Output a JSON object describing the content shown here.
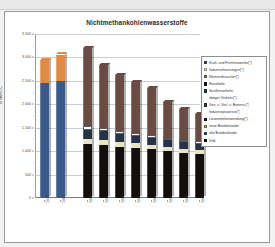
{
  "chart_data": {
    "type": "bar",
    "stacked": true,
    "title": "Nichtmethankohlenwasserstoffe",
    "xlabel": "",
    "ylabel": "kt NMVOC",
    "ylim": [
      0,
      3500
    ],
    "yticks": [
      0,
      500,
      1000,
      1500,
      2000,
      2500,
      3000,
      3500
    ],
    "ytick_labels": [
      "0",
      "500",
      "1.000",
      "1.500",
      "2.000",
      "2.500",
      "3.000",
      "3.500"
    ],
    "grid": true,
    "legend_position": "right",
    "categories": [
      "1970",
      "1980",
      "1990",
      "1991",
      "1992",
      "1993",
      "1994",
      "1995",
      "1996",
      "1997"
    ],
    "series": [
      {
        "name": "Kraft- und Fernheizwerke(*)",
        "color": "#3a5a8c",
        "values": [
          0,
          0,
          0,
          0,
          0,
          0,
          0,
          0,
          0,
          0
        ]
      },
      {
        "name": "Industriefeuerungen(*)",
        "color": "#e8e4c0",
        "values": [
          0,
          0,
          0,
          0,
          0,
          0,
          0,
          0,
          0,
          0
        ]
      },
      {
        "name": "Kleinverbraucher(*)",
        "color": "#9e6a6a",
        "values": [
          0,
          0,
          0,
          0,
          0,
          0,
          0,
          0,
          0,
          0
        ]
      },
      {
        "name": "Haushalte",
        "color": "#1b1b2a",
        "values": [
          0,
          0,
          0,
          0,
          0,
          0,
          0,
          0,
          0,
          0
        ]
      },
      {
        "name": "Straßenverkehr",
        "color": "#24435f",
        "values": [
          0,
          0,
          0,
          0,
          0,
          0,
          0,
          0,
          0,
          0
        ]
      },
      {
        "name": "übriger Verkehr(*)",
        "color": "#ffffff",
        "values": [
          0,
          0,
          0,
          0,
          0,
          0,
          0,
          0,
          0,
          0
        ]
      },
      {
        "name": "Ges. u. Verl. v. Brennst.(*)",
        "color": "#2f3b55",
        "values": [
          0,
          0,
          0,
          0,
          0,
          0,
          0,
          0,
          0,
          0
        ]
      },
      {
        "name": "Industrieprozesse(*)",
        "color": "#ffffff",
        "values": [
          0,
          0,
          0,
          0,
          0,
          0,
          0,
          0,
          0,
          0
        ]
      },
      {
        "name": "Lösemittelverwendung(*)",
        "color": "#1e1e1e",
        "values": [
          0,
          0,
          0,
          0,
          0,
          0,
          0,
          0,
          0,
          0
        ]
      },
      {
        "name": "neue Bundesländer",
        "color": "#e08a43",
        "values": [
          490,
          560,
          0,
          0,
          0,
          0,
          0,
          0,
          0,
          0
        ]
      },
      {
        "name": "alte Bundesländer",
        "color": "#3a5a8c",
        "values": [
          2450,
          2500,
          0,
          0,
          0,
          0,
          0,
          0,
          0,
          0
        ]
      },
      {
        "name": "Dtld.",
        "color": "#120f0d",
        "values": [
          0,
          0,
          3200,
          2830,
          2620,
          2470,
          2350,
          2040,
          1900,
          1790
        ]
      }
    ],
    "stacks": {
      "1970": [
        {
          "color": "#3a5a8c",
          "value": 2450
        },
        {
          "color": "#e08a43",
          "value": 490
        }
      ],
      "1980": [
        {
          "color": "#3a5a8c",
          "value": 2500
        },
        {
          "color": "#e08a43",
          "value": 560
        }
      ],
      "1990": [
        {
          "color": "#120f0d",
          "value": 1150
        },
        {
          "color": "#e8e4c0",
          "value": 120
        },
        {
          "color": "#253247",
          "value": 190
        },
        {
          "color": "#ffffff",
          "value": 75
        },
        {
          "color": "#6b4a42",
          "value": 1665
        }
      ],
      "1991": [
        {
          "color": "#120f0d",
          "value": 1130
        },
        {
          "color": "#e8e4c0",
          "value": 115
        },
        {
          "color": "#253247",
          "value": 175
        },
        {
          "color": "#ffffff",
          "value": 70
        },
        {
          "color": "#6b4a42",
          "value": 1340
        }
      ],
      "1992": [
        {
          "color": "#120f0d",
          "value": 1090
        },
        {
          "color": "#e8e4c0",
          "value": 110
        },
        {
          "color": "#253247",
          "value": 165
        },
        {
          "color": "#ffffff",
          "value": 65
        },
        {
          "color": "#6b4a42",
          "value": 1190
        }
      ],
      "1993": [
        {
          "color": "#120f0d",
          "value": 1060
        },
        {
          "color": "#e8e4c0",
          "value": 105
        },
        {
          "color": "#253247",
          "value": 155
        },
        {
          "color": "#ffffff",
          "value": 60
        },
        {
          "color": "#6b4a42",
          "value": 1090
        }
      ],
      "1994": [
        {
          "color": "#120f0d",
          "value": 1040
        },
        {
          "color": "#e8e4c0",
          "value": 100
        },
        {
          "color": "#253247",
          "value": 150
        },
        {
          "color": "#ffffff",
          "value": 58
        },
        {
          "color": "#6b4a42",
          "value": 1002
        }
      ],
      "1995": [
        {
          "color": "#120f0d",
          "value": 1000
        },
        {
          "color": "#e8e4c0",
          "value": 95
        },
        {
          "color": "#253247",
          "value": 140
        },
        {
          "color": "#ffffff",
          "value": 55
        },
        {
          "color": "#6b4a42",
          "value": 750
        }
      ],
      "1996": [
        {
          "color": "#120f0d",
          "value": 965
        },
        {
          "color": "#e8e4c0",
          "value": 90
        },
        {
          "color": "#253247",
          "value": 135
        },
        {
          "color": "#ffffff",
          "value": 52
        },
        {
          "color": "#6b4a42",
          "value": 658
        }
      ],
      "1997": [
        {
          "color": "#120f0d",
          "value": 940
        },
        {
          "color": "#e8e4c0",
          "value": 88
        },
        {
          "color": "#253247",
          "value": 130
        },
        {
          "color": "#ffffff",
          "value": 50
        },
        {
          "color": "#6b4a42",
          "value": 582
        }
      ]
    }
  },
  "legend": {
    "items": [
      {
        "label": "Kraft- und Fernheizwerke(*)",
        "color": "#3a5a8c"
      },
      {
        "label": "Industriefeuerungen(*)",
        "color": "#e8e4c0"
      },
      {
        "label": "Kleinverbraucher(*)",
        "color": "#9e6a6a"
      },
      {
        "label": "Haushalte",
        "color": "#1b1b2a"
      },
      {
        "label": "Straßenverkehr",
        "color": "#24435f"
      },
      {
        "label": "übriger Verkehr(*)",
        "color": "none"
      },
      {
        "label": "Ges. u. Verl. v. Brennst.(*)",
        "color": "#2f3b55"
      },
      {
        "label": "Industrieprozesse(*)",
        "color": "none"
      },
      {
        "label": "Lösemittelverwendung(*)",
        "color": "#1e1e1e"
      },
      {
        "label": "neue Bundesländer",
        "color": "#e08a43"
      },
      {
        "label": "alte Bundesländer",
        "color": "#3a5a8c"
      },
      {
        "label": "Dtld.",
        "color": "#120f0d"
      }
    ]
  }
}
